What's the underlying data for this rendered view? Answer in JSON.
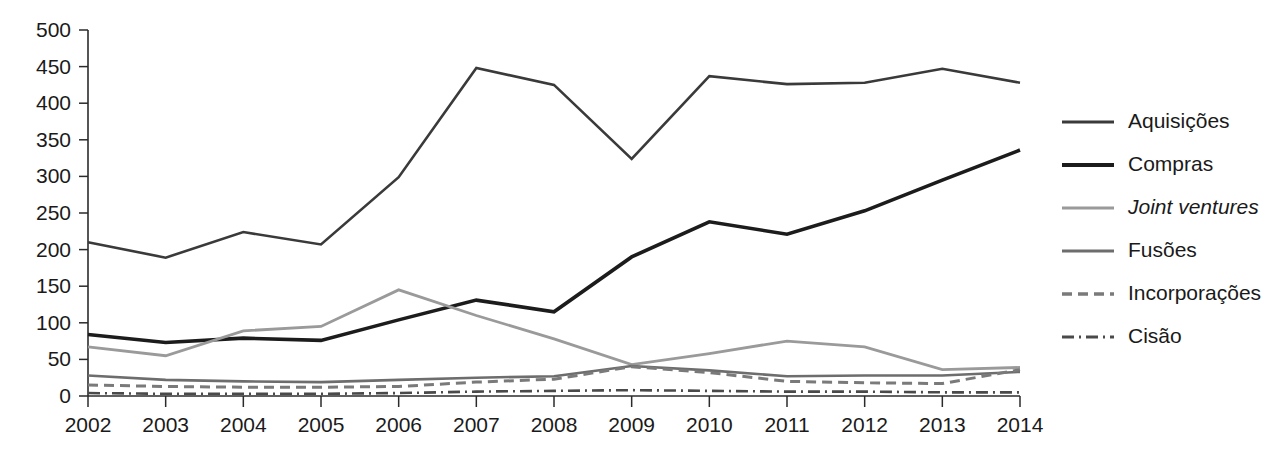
{
  "chart_data": {
    "type": "line",
    "title": "",
    "xlabel": "",
    "ylabel": "",
    "categories": [
      "2002",
      "2003",
      "2004",
      "2005",
      "2006",
      "2007",
      "2008",
      "2009",
      "2010",
      "2011",
      "2012",
      "2013",
      "2014"
    ],
    "x_tick_labels": [
      "2002",
      "2003",
      "2004",
      "2005",
      "2006",
      "2007",
      "2008",
      "2009",
      "2010",
      "2011",
      "2012",
      "2013",
      "2014"
    ],
    "y_tick_labels": [
      "0",
      "50",
      "100",
      "150",
      "200",
      "250",
      "300",
      "350",
      "400",
      "450",
      "500"
    ],
    "y_ticks": [
      0,
      50,
      100,
      150,
      200,
      250,
      300,
      350,
      400,
      450,
      500
    ],
    "ylim": [
      0,
      500
    ],
    "grid": false,
    "legend_position": "right",
    "series": [
      {
        "name": "Aquisições",
        "color": "#3a3a3a",
        "width": 2.6,
        "dash": "none",
        "italic": false,
        "values": [
          210,
          189,
          224,
          207,
          299,
          448,
          425,
          324,
          437,
          426,
          428,
          447,
          428
        ]
      },
      {
        "name": "Compras",
        "color": "#1c1c1c",
        "width": 3.6,
        "dash": "none",
        "italic": false,
        "values": [
          84,
          73,
          79,
          76,
          104,
          131,
          115,
          190,
          238,
          221,
          253,
          295,
          336
        ]
      },
      {
        "name": "Joint ventures",
        "color": "#9a9a9a",
        "width": 2.8,
        "dash": "none",
        "italic": true,
        "values": [
          67,
          55,
          89,
          95,
          145,
          110,
          78,
          43,
          58,
          75,
          67,
          36,
          39
        ]
      },
      {
        "name": "Fusões",
        "color": "#6d6d6d",
        "width": 2.6,
        "dash": "none",
        "italic": false,
        "values": [
          28,
          22,
          20,
          19,
          22,
          25,
          27,
          41,
          35,
          27,
          28,
          28,
          33
        ]
      },
      {
        "name": "Incorporações",
        "color": "#7a7a7a",
        "width": 3.0,
        "dash": "10,6",
        "italic": false,
        "values": [
          15,
          13,
          12,
          12,
          13,
          19,
          23,
          40,
          32,
          20,
          18,
          17,
          36
        ]
      },
      {
        "name": "Cisão",
        "color": "#4a4a4a",
        "width": 2.6,
        "dash": "12,5,2,5",
        "italic": false,
        "values": [
          4,
          3,
          3,
          3,
          4,
          6,
          7,
          8,
          7,
          6,
          6,
          5,
          5
        ]
      }
    ]
  },
  "legend": {
    "entries": [
      {
        "label": "Aquisições"
      },
      {
        "label": "Compras"
      },
      {
        "label": "Joint ventures"
      },
      {
        "label": "Fusões"
      },
      {
        "label": "Incorporações"
      },
      {
        "label": "Cisão"
      }
    ]
  }
}
